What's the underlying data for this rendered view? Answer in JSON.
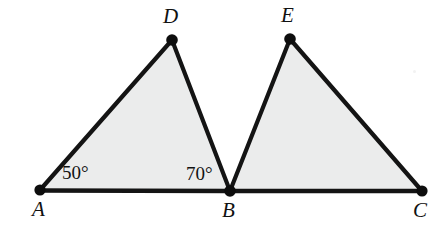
{
  "figure": {
    "type": "geometry-diagram",
    "canvas": {
      "width": 448,
      "height": 229
    },
    "background_color": "#ffffff",
    "fill_color": "#ebecec",
    "stroke_color": "#141414"
  },
  "points": [
    {
      "id": "A",
      "label": "A",
      "x": 40,
      "y": 190,
      "label_x": 32,
      "label_y": 199,
      "label_position": "below-left"
    },
    {
      "id": "B",
      "label": "B",
      "x": 230,
      "y": 191,
      "label_x": 222,
      "label_y": 200,
      "label_position": "below"
    },
    {
      "id": "C",
      "label": "C",
      "x": 422,
      "y": 191,
      "label_x": 413,
      "label_y": 200,
      "label_position": "below"
    },
    {
      "id": "D",
      "label": "D",
      "x": 172,
      "y": 40,
      "label_x": 163,
      "label_y": 6,
      "label_position": "above"
    },
    {
      "id": "E",
      "label": "E",
      "x": 290,
      "y": 39,
      "label_x": 281,
      "label_y": 5,
      "label_position": "above"
    }
  ],
  "segments": [
    {
      "id": "AB",
      "from": "A",
      "to": "B",
      "kind": "baseline"
    },
    {
      "id": "BC",
      "from": "B",
      "to": "C",
      "kind": "baseline"
    },
    {
      "id": "AD",
      "from": "A",
      "to": "D",
      "kind": "edge"
    },
    {
      "id": "DB",
      "from": "D",
      "to": "B",
      "kind": "edge"
    },
    {
      "id": "BE",
      "from": "B",
      "to": "E",
      "kind": "edge"
    },
    {
      "id": "EC",
      "from": "E",
      "to": "C",
      "kind": "edge"
    }
  ],
  "polygons": [
    {
      "id": "ABD",
      "vertices": [
        "A",
        "B",
        "D"
      ],
      "shaded": true
    },
    {
      "id": "BCE",
      "vertices": [
        "B",
        "C",
        "E"
      ],
      "shaded": true
    }
  ],
  "angle_labels": [
    {
      "id": "angle-A",
      "text": "50°",
      "at_vertex": "A",
      "x": 62,
      "y": 163,
      "value": 50
    },
    {
      "id": "angle-DBA",
      "text": "70°",
      "at_vertex": "B",
      "x": 186,
      "y": 164,
      "value": 70
    }
  ]
}
